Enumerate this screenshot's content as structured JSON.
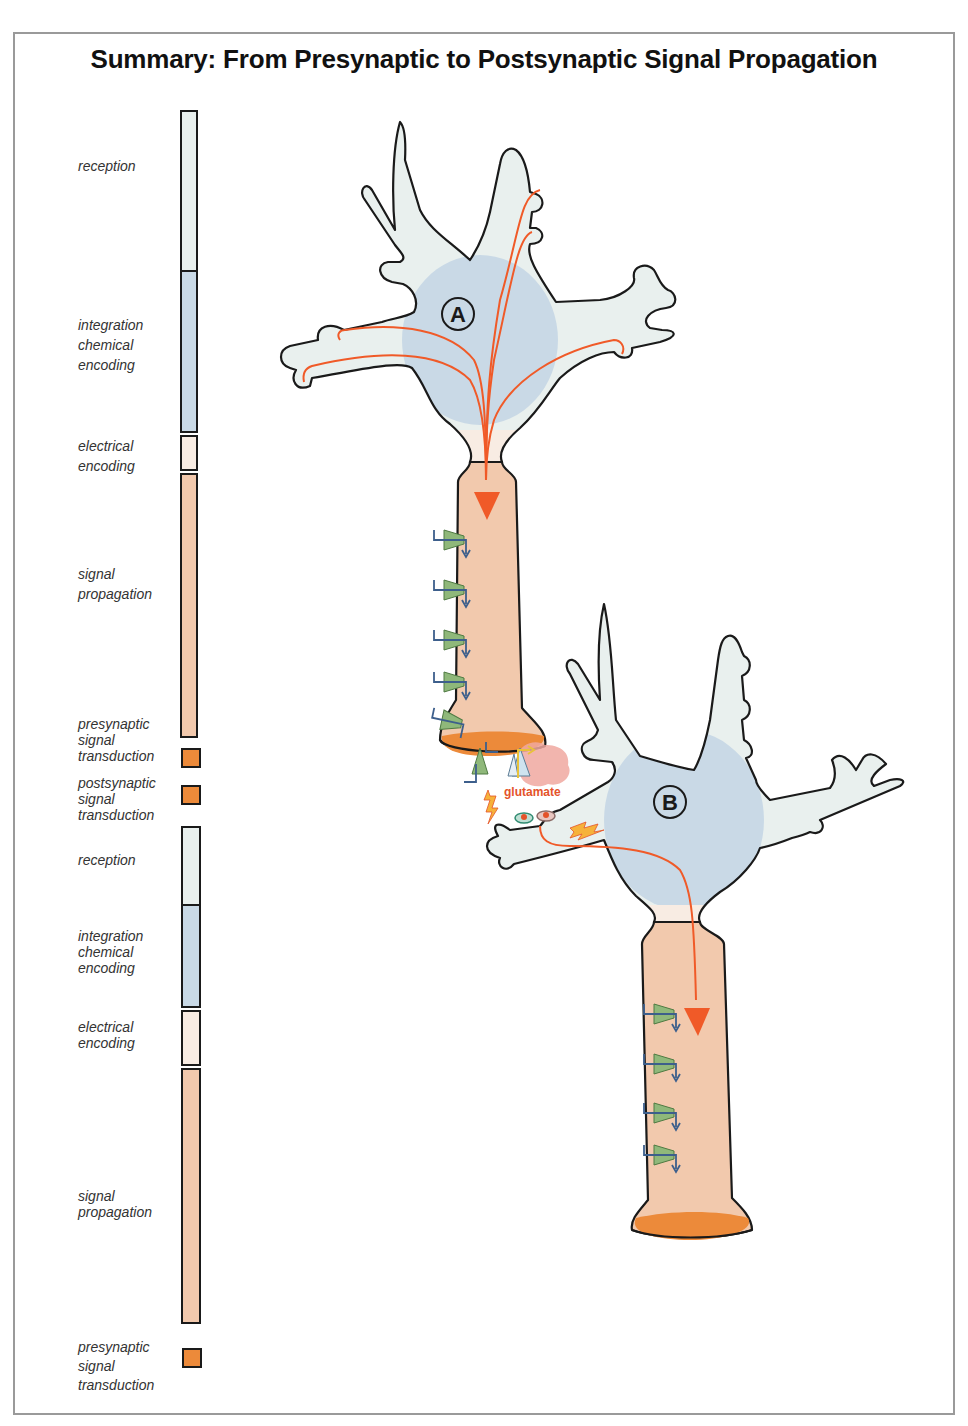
{
  "title": "Summary: From Presynaptic to Postsynaptic Signal Propagation",
  "colors": {
    "reception": "#e9f0ee",
    "integration": "#c9d9e6",
    "electrical": "#f8ece3",
    "propagation": "#f2c9ad",
    "transduction": "#ec8a3a",
    "signal_arrow": "#f05a28",
    "channel_green": "#8fb87a",
    "channel_arrow": "#3d5f8c",
    "glutamate_cloud": "#f0a8a0",
    "glutamate_text": "#e4532a"
  },
  "stages": [
    {
      "label_lines": [
        "reception"
      ],
      "color_key": "reception"
    },
    {
      "label_lines": [
        "integration",
        "chemical",
        "encoding"
      ],
      "color_key": "integration"
    },
    {
      "label_lines": [
        "electrical",
        "encoding"
      ],
      "color_key": "electrical"
    },
    {
      "label_lines": [
        "signal",
        "propagation"
      ],
      "color_key": "propagation"
    },
    {
      "label_lines": [
        "presynaptic",
        "signal",
        "transduction"
      ],
      "color_key": "transduction"
    },
    {
      "label_lines": [
        "postsynaptic",
        "signal",
        "transduction"
      ],
      "color_key": "transduction"
    },
    {
      "label_lines": [
        "reception"
      ],
      "color_key": "reception"
    },
    {
      "label_lines": [
        "integration",
        "chemical",
        "encoding"
      ],
      "color_key": "integration"
    },
    {
      "label_lines": [
        "electrical",
        "encoding"
      ],
      "color_key": "electrical"
    },
    {
      "label_lines": [
        "signal",
        "propagation"
      ],
      "color_key": "propagation"
    },
    {
      "label_lines": [
        "presynaptic",
        "signal",
        "transduction"
      ],
      "color_key": "transduction"
    }
  ],
  "labels": {
    "s0": "reception",
    "s1a": "integration",
    "s1b": "chemical",
    "s1c": "encoding",
    "s2a": "electrical",
    "s2b": "encoding",
    "s3a": "signal",
    "s3b": "propagation",
    "s4a": "presynaptic",
    "s4b": "signal",
    "s4c": "transduction",
    "s5a": "postsynaptic",
    "s5b": "signal",
    "s5c": "transduction",
    "s6": "reception",
    "s7a": "integration",
    "s7b": "chemical",
    "s7c": "encoding",
    "s8a": "electrical",
    "s8b": "encoding",
    "s9a": "signal",
    "s9b": "propagation",
    "s10a": "presynaptic",
    "s10b": "signal",
    "s10c": "transduction"
  },
  "neurons": {
    "a": {
      "label": "A"
    },
    "b": {
      "label": "B"
    }
  },
  "synapse": {
    "neurotransmitter": "glutamate"
  }
}
